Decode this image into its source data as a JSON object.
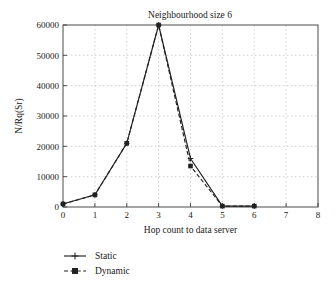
{
  "chart_data": {
    "type": "line",
    "title": "Neighbourhood size 6",
    "xlabel": "Hop count to data server",
    "ylabel": "N/Rq(Sr)",
    "x": [
      0,
      1,
      2,
      3,
      4,
      5,
      6
    ],
    "xlim": [
      0,
      8
    ],
    "ylim": [
      0,
      60000
    ],
    "xticks": [
      "0",
      "1",
      "2",
      "3",
      "4",
      "5",
      "6",
      "7",
      "8"
    ],
    "yticks": [
      "0",
      "10000",
      "20000",
      "30000",
      "40000",
      "50000",
      "60000"
    ],
    "grid": true,
    "legend_position": "below-left",
    "series": [
      {
        "name": "Static",
        "style": "solid",
        "marker": "plus",
        "values": [
          1000,
          4000,
          21000,
          60000,
          16000,
          300,
          300
        ]
      },
      {
        "name": "Dynamic",
        "style": "dashed",
        "marker": "square",
        "values": [
          1000,
          4000,
          21000,
          60000,
          13500,
          300,
          300
        ]
      }
    ]
  },
  "legend": {
    "items": [
      {
        "label": "Static"
      },
      {
        "label": "Dynamic"
      }
    ]
  },
  "colors": {
    "line": "#222222",
    "axis": "#4a4a4a",
    "grid": "#b9b9b9",
    "text": "#1a1a1a",
    "background": "#ffffff"
  }
}
